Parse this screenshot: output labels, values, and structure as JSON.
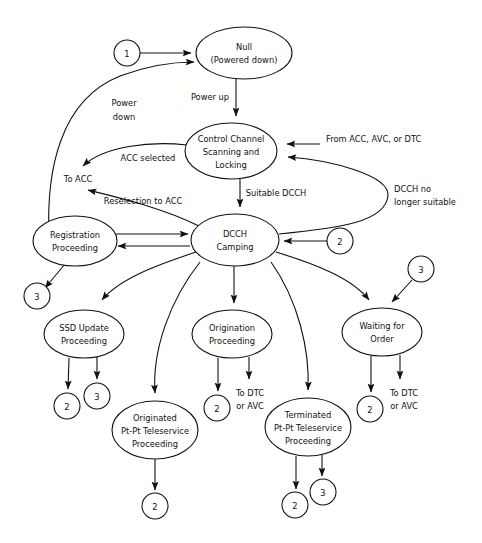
{
  "diagram": {
    "type": "state-transition-diagram",
    "background_color": "#ffffff",
    "stroke_color": "#111111",
    "nodes": [
      {
        "id": "null",
        "label_lines": [
          "Null",
          "(Powered down)"
        ],
        "cx": 244,
        "cy": 53,
        "rx": 48,
        "ry": 26
      },
      {
        "id": "control_channel",
        "label_lines": [
          "Control Channel",
          "Scanning and",
          "Locking"
        ],
        "cx": 231,
        "cy": 151,
        "rx": 46,
        "ry": 28
      },
      {
        "id": "dcch_camping",
        "label_lines": [
          "DCCH",
          "Camping"
        ],
        "cx": 235,
        "cy": 240,
        "rx": 44,
        "ry": 26
      },
      {
        "id": "registration",
        "label_lines": [
          "Registration",
          "Proceeding"
        ],
        "cx": 75,
        "cy": 241,
        "rx": 42,
        "ry": 25
      },
      {
        "id": "ssd_update",
        "label_lines": [
          "SSD Update",
          "Proceeding"
        ],
        "cx": 84,
        "cy": 334,
        "rx": 40,
        "ry": 24
      },
      {
        "id": "origination",
        "label_lines": [
          "Origination",
          "Proceeding"
        ],
        "cx": 232,
        "cy": 334,
        "rx": 40,
        "ry": 24
      },
      {
        "id": "waiting_order",
        "label_lines": [
          "Waiting for",
          "Order"
        ],
        "cx": 382,
        "cy": 332,
        "rx": 40,
        "ry": 24
      },
      {
        "id": "originated_ptp",
        "label_lines": [
          "Originated",
          "Pt-Pt Teleservice",
          "Proceeding"
        ],
        "cx": 155,
        "cy": 430,
        "rx": 43,
        "ry": 29
      },
      {
        "id": "terminated_ptp",
        "label_lines": [
          "Terminated",
          "Pt-Pt Teleservice",
          "Proceeding"
        ],
        "cx": 308,
        "cy": 427,
        "rx": 43,
        "ry": 29
      }
    ],
    "connectors": [
      {
        "id": "c1_to_null",
        "label": "1",
        "cx": 127,
        "cy": 53,
        "r": 13
      },
      {
        "id": "c2_to_dcch",
        "label": "2",
        "cx": 340,
        "cy": 241,
        "r": 13
      },
      {
        "id": "c3_to_waiting",
        "label": "3",
        "cx": 421,
        "cy": 269,
        "r": 13
      },
      {
        "id": "c3_from_registration",
        "label": "3",
        "cx": 37,
        "cy": 296,
        "r": 13
      },
      {
        "id": "c2_from_ssd",
        "label": "2",
        "cx": 67,
        "cy": 406,
        "r": 13
      },
      {
        "id": "c3_from_ssd",
        "label": "3",
        "cx": 97,
        "cy": 396,
        "r": 13
      },
      {
        "id": "c2_from_origination",
        "label": "2",
        "cx": 217,
        "cy": 408,
        "r": 13
      },
      {
        "id": "c2_from_waiting",
        "label": "2",
        "cx": 370,
        "cy": 409,
        "r": 13
      },
      {
        "id": "c2_from_orig_ptp",
        "label": "2",
        "cx": 155,
        "cy": 506,
        "r": 13
      },
      {
        "id": "c2_from_term_ptp",
        "label": "2",
        "cx": 295,
        "cy": 505,
        "r": 13
      },
      {
        "id": "c3_from_term_ptp",
        "label": "3",
        "cx": 323,
        "cy": 492,
        "r": 13
      }
    ],
    "edge_labels": [
      {
        "id": "power_down",
        "lines": [
          "Power",
          "down"
        ],
        "x": 124,
        "y": 103,
        "anchor": "middle"
      },
      {
        "id": "power_up",
        "lines": [
          "Power up"
        ],
        "x": 210,
        "y": 97,
        "anchor": "middle"
      },
      {
        "id": "acc_selected",
        "lines": [
          "ACC selected"
        ],
        "x": 148,
        "y": 158,
        "anchor": "middle"
      },
      {
        "id": "to_acc",
        "lines": [
          "To ACC"
        ],
        "x": 78,
        "y": 179,
        "anchor": "middle"
      },
      {
        "id": "reselection_to_acc",
        "lines": [
          "Reselection to ACC"
        ],
        "x": 143,
        "y": 201,
        "anchor": "middle"
      },
      {
        "id": "suitable_dcch",
        "lines": [
          "Suitable DCCH"
        ],
        "x": 276,
        "y": 193,
        "anchor": "middle"
      },
      {
        "id": "from_acc_avc_dtc",
        "lines": [
          "From ACC, AVC, or DTC"
        ],
        "x": 326,
        "y": 139,
        "anchor": "start"
      },
      {
        "id": "dcch_no_longer",
        "lines": [
          "DCCH no",
          "longer suitable"
        ],
        "x": 394,
        "y": 189,
        "anchor": "start"
      },
      {
        "id": "to_dtc_or_avc_origination",
        "lines": [
          "To DTC",
          "or AVC"
        ],
        "x": 250,
        "y": 393,
        "anchor": "middle"
      },
      {
        "id": "to_dtc_or_avc_waiting",
        "lines": [
          "To DTC",
          "or AVC"
        ],
        "x": 404,
        "y": 393,
        "anchor": "middle"
      }
    ]
  }
}
